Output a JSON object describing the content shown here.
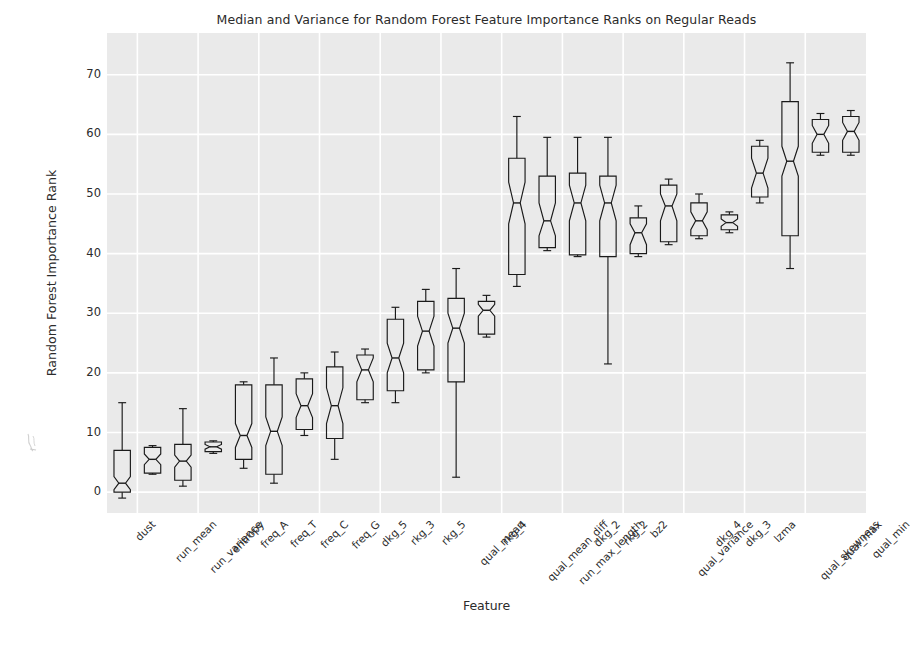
{
  "chart_data": {
    "type": "boxplot",
    "title": "Median and Variance for Random Forest Feature Importance Ranks on Regular Reads",
    "xlabel": "Feature",
    "ylabel": "Random Forest Importance Rank",
    "ylim": [
      -3.5,
      77
    ],
    "yticks": [
      0,
      10,
      20,
      30,
      40,
      50,
      60,
      70
    ],
    "ytick_labels": [
      "0",
      "10",
      "20",
      "30",
      "40",
      "50",
      "60",
      "70"
    ],
    "grid": true,
    "grid_color": "#ffffff",
    "plot_bg": "#eaeaea",
    "figure_bg": "#ffffff",
    "box_line_color": "#1a1a1a",
    "notched": true,
    "legend": "none",
    "categories": [
      "dust",
      "run_mean",
      "run_variance",
      "entropy",
      "freq_A",
      "freq_T",
      "freq_C",
      "freq_G",
      "dkg_5",
      "rkg_3",
      "rkg_5",
      "qual_mean",
      "rkg_4",
      "qual_mean_diff",
      "run_max_length",
      "dkg_2",
      "rkg_2",
      "bz2",
      "qual_variance",
      "dkg_4",
      "dkg_3",
      "lzma",
      "qual_skewness",
      "qual_max",
      "qual_min"
    ],
    "boxes": [
      {
        "label": "dust",
        "whislo": -1.0,
        "q1": 0.0,
        "med": 1.5,
        "q3": 7.0,
        "whishi": 15.0,
        "cilo": 0.4,
        "cihi": 2.6
      },
      {
        "label": "run_mean",
        "whislo": 3.0,
        "q1": 3.2,
        "med": 5.5,
        "q3": 7.5,
        "whishi": 7.8,
        "cilo": 4.6,
        "cihi": 6.4
      },
      {
        "label": "run_variance",
        "whislo": 1.0,
        "q1": 2.0,
        "med": 5.2,
        "q3": 8.0,
        "whishi": 14.0,
        "cilo": 4.2,
        "cihi": 6.2
      },
      {
        "label": "entropy",
        "whislo": 6.5,
        "q1": 6.8,
        "med": 7.6,
        "q3": 8.4,
        "whishi": 8.6,
        "cilo": 7.2,
        "cihi": 8.0
      },
      {
        "label": "freq_A",
        "whislo": 4.0,
        "q1": 5.5,
        "med": 9.5,
        "q3": 18.0,
        "whishi": 18.5,
        "cilo": 7.5,
        "cihi": 11.5
      },
      {
        "label": "freq_T",
        "whislo": 1.5,
        "q1": 3.0,
        "med": 10.2,
        "q3": 18.0,
        "whishi": 22.5,
        "cilo": 7.8,
        "cihi": 12.6
      },
      {
        "label": "freq_C",
        "whislo": 9.5,
        "q1": 10.5,
        "med": 14.5,
        "q3": 19.0,
        "whishi": 20.0,
        "cilo": 12.5,
        "cihi": 16.5
      },
      {
        "label": "freq_G",
        "whislo": 5.5,
        "q1": 9.0,
        "med": 14.5,
        "q3": 21.0,
        "whishi": 23.5,
        "cilo": 11.5,
        "cihi": 17.5
      },
      {
        "label": "dkg_5",
        "whislo": 15.0,
        "q1": 15.5,
        "med": 20.5,
        "q3": 23.0,
        "whishi": 24.0,
        "cilo": 18.5,
        "cihi": 22.5
      },
      {
        "label": "rkg_3",
        "whislo": 15.0,
        "q1": 17.0,
        "med": 22.5,
        "q3": 29.0,
        "whishi": 31.0,
        "cilo": 20.0,
        "cihi": 25.0
      },
      {
        "label": "rkg_5",
        "whislo": 20.0,
        "q1": 20.5,
        "med": 27.0,
        "q3": 32.0,
        "whishi": 34.0,
        "cilo": 24.5,
        "cihi": 29.5
      },
      {
        "label": "qual_mean",
        "whislo": 2.5,
        "q1": 18.5,
        "med": 27.5,
        "q3": 32.5,
        "whishi": 37.5,
        "cilo": 25.0,
        "cihi": 30.0
      },
      {
        "label": "rkg_4",
        "whislo": 26.0,
        "q1": 26.5,
        "med": 30.5,
        "q3": 32.0,
        "whishi": 33.0,
        "cilo": 29.5,
        "cihi": 31.5
      },
      {
        "label": "qual_mean_diff",
        "whislo": 34.5,
        "q1": 36.5,
        "med": 48.5,
        "q3": 56.0,
        "whishi": 63.0,
        "cilo": 45.0,
        "cihi": 52.0
      },
      {
        "label": "run_max_length",
        "whislo": 40.5,
        "q1": 41.0,
        "med": 45.5,
        "q3": 53.0,
        "whishi": 59.5,
        "cilo": 43.0,
        "cihi": 48.5
      },
      {
        "label": "dkg_2",
        "whislo": 39.5,
        "q1": 39.8,
        "med": 48.5,
        "q3": 53.5,
        "whishi": 59.5,
        "cilo": 45.5,
        "cihi": 51.5
      },
      {
        "label": "rkg_2",
        "whislo": 21.5,
        "q1": 39.5,
        "med": 48.5,
        "q3": 53.0,
        "whishi": 59.5,
        "cilo": 45.5,
        "cihi": 51.5
      },
      {
        "label": "bz2",
        "whislo": 39.5,
        "q1": 40.0,
        "med": 43.5,
        "q3": 46.0,
        "whishi": 48.0,
        "cilo": 41.5,
        "cihi": 45.0
      },
      {
        "label": "qual_variance",
        "whislo": 41.5,
        "q1": 42.0,
        "med": 48.0,
        "q3": 51.5,
        "whishi": 52.5,
        "cilo": 45.5,
        "cihi": 50.0
      },
      {
        "label": "dkg_4",
        "whislo": 42.5,
        "q1": 43.0,
        "med": 45.5,
        "q3": 48.5,
        "whishi": 50.0,
        "cilo": 44.0,
        "cihi": 47.0
      },
      {
        "label": "dkg_3",
        "whislo": 43.5,
        "q1": 44.0,
        "med": 45.2,
        "q3": 46.5,
        "whishi": 47.0,
        "cilo": 44.6,
        "cihi": 45.8
      },
      {
        "label": "lzma",
        "whislo": 48.5,
        "q1": 49.5,
        "med": 53.5,
        "q3": 58.0,
        "whishi": 59.0,
        "cilo": 51.0,
        "cihi": 56.0
      },
      {
        "label": "qual_skewness",
        "whislo": 37.5,
        "q1": 43.0,
        "med": 55.5,
        "q3": 65.5,
        "whishi": 72.0,
        "cilo": 53.0,
        "cihi": 58.0
      },
      {
        "label": "qual_max",
        "whislo": 56.5,
        "q1": 57.0,
        "med": 60.0,
        "q3": 62.5,
        "whishi": 63.5,
        "cilo": 58.5,
        "cihi": 61.5
      },
      {
        "label": "qual_min",
        "whislo": 56.5,
        "q1": 57.0,
        "med": 60.5,
        "q3": 63.0,
        "whishi": 64.0,
        "cilo": 59.0,
        "cihi": 62.0
      }
    ]
  }
}
